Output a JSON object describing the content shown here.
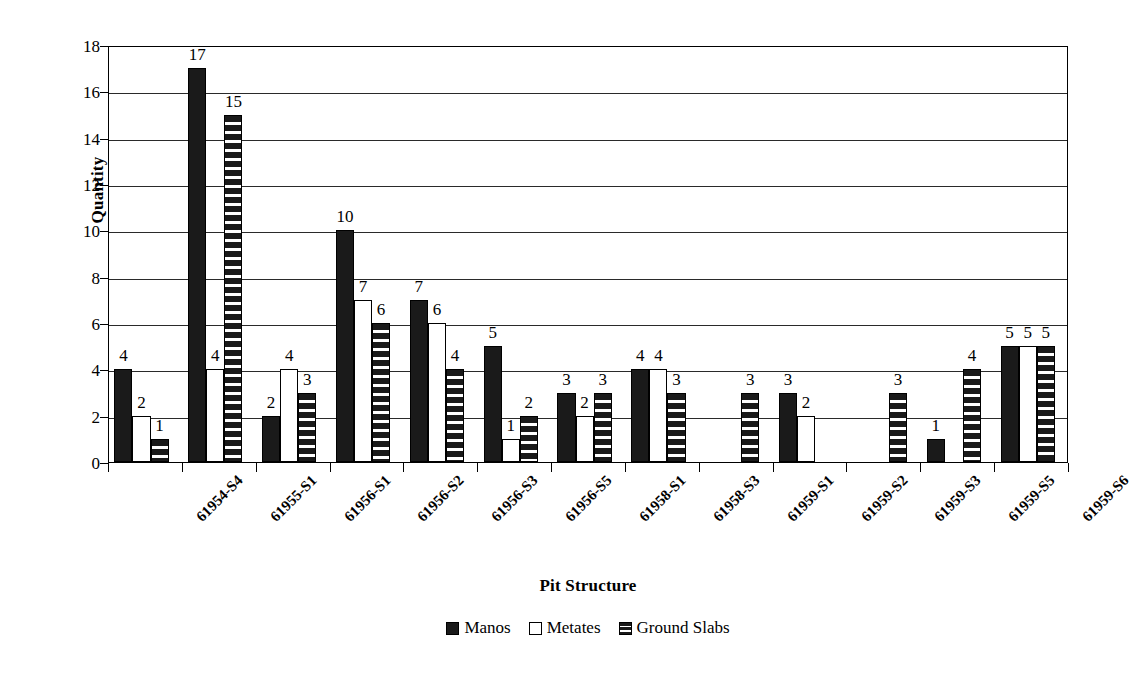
{
  "chart_data": {
    "type": "bar",
    "title": "",
    "xlabel": "Pit Structure",
    "ylabel": "Quantity",
    "ylim": [
      0,
      18
    ],
    "ytick_step": 2,
    "yticks": [
      0,
      2,
      4,
      6,
      8,
      10,
      12,
      14,
      16,
      18
    ],
    "grid": "horizontal",
    "legend_position": "bottom-center",
    "categories": [
      "61954-S4",
      "61955-S1",
      "61956-S1",
      "61956-S2",
      "61956-S3",
      "61956-S5",
      "61958-S1",
      "61958-S3",
      "61959-S1",
      "61959-S2",
      "61959-S3",
      "61959-S5",
      "61959-S6"
    ],
    "series": [
      {
        "name": "Manos",
        "fill": "solid-black",
        "values": [
          4,
          17,
          2,
          10,
          7,
          5,
          3,
          4,
          0,
          3,
          0,
          1,
          5
        ]
      },
      {
        "name": "Metates",
        "fill": "white-outline",
        "values": [
          2,
          4,
          4,
          7,
          6,
          1,
          2,
          4,
          0,
          2,
          0,
          0,
          5
        ]
      },
      {
        "name": "Ground Slabs",
        "fill": "horizontal-stripes",
        "values": [
          1,
          15,
          3,
          6,
          4,
          2,
          3,
          3,
          3,
          0,
          3,
          4,
          5
        ]
      }
    ],
    "colors": {
      "manos": "#1a1a1a",
      "metates": "#ffffff",
      "ground_slabs": "#1a1a1a",
      "outline": "#000000",
      "grid": "#2a2a2a",
      "background": "#ffffff"
    }
  },
  "legend": {
    "items": [
      {
        "label": "Manos",
        "key": "manos"
      },
      {
        "label": "Metates",
        "key": "metates"
      },
      {
        "label": "Ground Slabs",
        "key": "slabs"
      }
    ]
  }
}
